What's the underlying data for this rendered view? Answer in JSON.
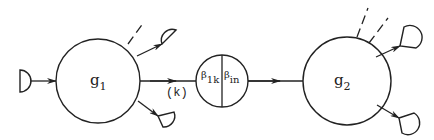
{
  "diagram": {
    "type": "network-node-coupling",
    "nodes": [
      {
        "id": "g1",
        "label": "g",
        "subscript": "1"
      },
      {
        "id": "coupler",
        "left_label": "β",
        "left_subscript": "1k",
        "right_label": "β",
        "right_subscript": "in"
      },
      {
        "id": "g2",
        "label": "g",
        "subscript": "2"
      }
    ],
    "edges": [
      {
        "from": "source-left",
        "to": "g1"
      },
      {
        "from": "g1",
        "to": "coupler",
        "label": "(k)"
      },
      {
        "from": "coupler",
        "to": "g2"
      },
      {
        "from": "g1",
        "to": "sink-g1-upper"
      },
      {
        "from": "g1",
        "to": "sink-g1-lower"
      },
      {
        "from": "g2",
        "to": "sink-g2-upper"
      },
      {
        "from": "g2",
        "to": "sink-g2-lower"
      }
    ],
    "edge_label_k": "(k)",
    "stroke_color": "#222222"
  }
}
